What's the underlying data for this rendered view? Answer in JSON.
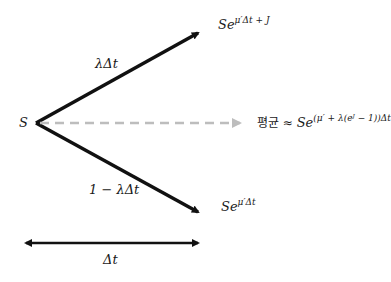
{
  "diagram": {
    "title": "",
    "nodes": {
      "start": "S",
      "up_base": "Se",
      "up_exp": "μ′Δt + J",
      "down_base": "Se",
      "down_exp": "μ′Δt",
      "mean_prefix": "평균 ≈ ",
      "mean_base": "Se",
      "mean_exp": "(μ′ + λ(eᴶ − 1))Δt"
    },
    "edges": {
      "up_prob": "λΔt",
      "down_prob": "1 − λΔt"
    },
    "time_span": "Δt",
    "colors": {
      "arrow": "#111111",
      "dashed_arrow": "#bdbdbd"
    }
  }
}
